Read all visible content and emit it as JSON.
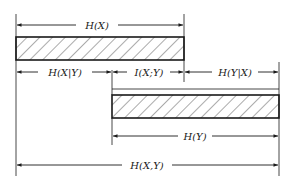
{
  "diagram": {
    "colors": {
      "stroke": "#1a1a1a",
      "hatch": "#444444",
      "background": "#ffffff"
    },
    "bars": [
      {
        "id": "bar-x",
        "represents": "H(X)",
        "hatched": true
      },
      {
        "id": "bar-y",
        "represents": "H(Y)",
        "hatched": true
      }
    ],
    "labels": {
      "hx": "H(X)",
      "hx_given_y": "H(X|Y)",
      "ixy": "I(X;Y)",
      "hy_given_x": "H(Y|X)",
      "hy": "H(Y)",
      "hxy": "H(X,Y)"
    }
  }
}
